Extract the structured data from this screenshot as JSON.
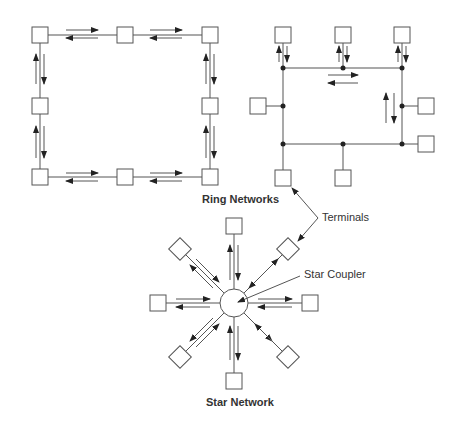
{
  "labels": {
    "ring_networks": "Ring Networks",
    "terminals": "Terminals",
    "star_coupler": "Star Coupler",
    "star_network": "Star Network"
  },
  "colors": {
    "line": "#555555",
    "box_fill": "#ffffff",
    "node": "#222222",
    "text": "#333333"
  },
  "diagrams": [
    {
      "name": "ring-network-point-to-point",
      "terminals": 8,
      "topology": "square ring with bidirectional arrows"
    },
    {
      "name": "ring-network-bus",
      "terminals": 8,
      "topology": "rectangular bus ring with tap nodes"
    },
    {
      "name": "star-network",
      "terminals": 8,
      "topology": "8 terminals around central star coupler"
    }
  ]
}
